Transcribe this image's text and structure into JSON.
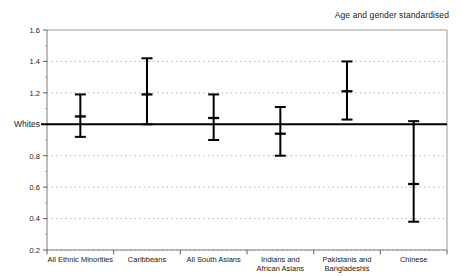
{
  "annotation": {
    "text": "Age and gender standardised"
  },
  "chart_data": {
    "type": "scatter",
    "title": "",
    "subtitle": "",
    "annotations": [
      "Age and gender standardised"
    ],
    "xlabel": "",
    "ylabel": "",
    "ylim": [
      0.2,
      1.6
    ],
    "ytick_values": [
      1.6,
      1.4,
      1.2,
      1.0,
      0.8,
      0.6,
      0.4,
      0.2
    ],
    "ytick_labels": [
      "1.6",
      "1.4",
      "1.2",
      "Whites",
      "0.8",
      "0.6",
      "0.4",
      "0.2"
    ],
    "grid": true,
    "grid_style": "dotted",
    "legend": "none",
    "reference_line": {
      "value": 1.0,
      "label": "Whites"
    },
    "categories": [
      "All Ethnic Minorities",
      "Caribbeans",
      "All South Asians",
      "Indians and African Asians",
      "Pakistanis and Bangladeshis",
      "Chinese"
    ],
    "series": [
      {
        "name": "Standardised ratio",
        "values": [
          1.05,
          1.19,
          1.04,
          0.94,
          1.21,
          0.62
        ],
        "ci_lower": [
          0.92,
          1.0,
          0.9,
          0.8,
          1.03,
          0.38
        ],
        "ci_upper": [
          1.19,
          1.42,
          1.19,
          1.11,
          1.4,
          1.02
        ]
      }
    ]
  }
}
